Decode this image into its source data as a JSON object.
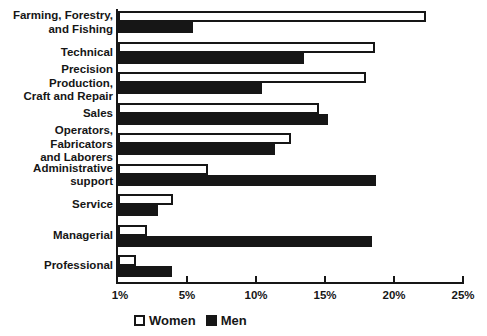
{
  "chart_data": {
    "type": "bar",
    "orientation": "horizontal",
    "title": "",
    "xlabel": "",
    "ylabel": "",
    "categories": [
      "Farming, Forestry,\nand Fishing",
      "Technical",
      "Precision Production,\nCraft and Repair",
      "Sales",
      "Operators, Fabricators\nand Laborers",
      "Administrative\nsupport",
      "Service",
      "Managerial",
      "Professional"
    ],
    "series": [
      {
        "name": "Women",
        "swatch": "white-outlined",
        "values": [
          22.3,
          18.6,
          18.0,
          14.6,
          12.5,
          6.5,
          4.0,
          2.1,
          1.3
        ]
      },
      {
        "name": "Men",
        "swatch": "black-filled",
        "values": [
          5.4,
          13.5,
          10.4,
          15.2,
          11.4,
          18.7,
          2.9,
          18.4,
          3.9
        ]
      }
    ],
    "xlim": [
      0,
      25
    ],
    "x_tick_values": [
      0,
      5,
      10,
      15,
      20,
      25
    ],
    "x_tick_labels": [
      "1%",
      "5%",
      "10%",
      "15%",
      "20%",
      "25%"
    ],
    "grid": false,
    "legend_position": "bottom",
    "colors": {
      "ink": "#161616",
      "background": "#ffffff",
      "women_fill": "#ffffff",
      "men_fill": "#161616"
    }
  }
}
